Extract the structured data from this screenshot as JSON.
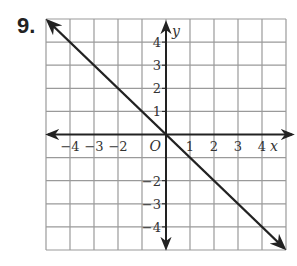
{
  "problem": {
    "number": "9."
  },
  "chart_data": {
    "type": "line",
    "title": "",
    "xlabel": "x",
    "ylabel": "y",
    "origin_label": "O",
    "xlim": [
      -5,
      5
    ],
    "ylim": [
      -5,
      5
    ],
    "grid": true,
    "x_ticks": [
      -4,
      -3,
      -2,
      1,
      2,
      3,
      4
    ],
    "x_tick_labels": [
      "−4",
      "−3",
      "−2",
      "1",
      "2",
      "3",
      "4"
    ],
    "y_ticks": [
      4,
      3,
      2,
      1,
      -2,
      -3,
      -4
    ],
    "y_tick_labels": [
      "4",
      "3",
      "2",
      "1",
      "−2",
      "−3",
      "−4"
    ],
    "series": [
      {
        "name": "line",
        "equation": "y = -x",
        "x": [
          -5,
          5
        ],
        "y": [
          5,
          -5
        ],
        "arrows": "both"
      }
    ],
    "colors": {
      "grid": "#9a9a9a",
      "axes": "#222222",
      "line": "#222222"
    }
  }
}
